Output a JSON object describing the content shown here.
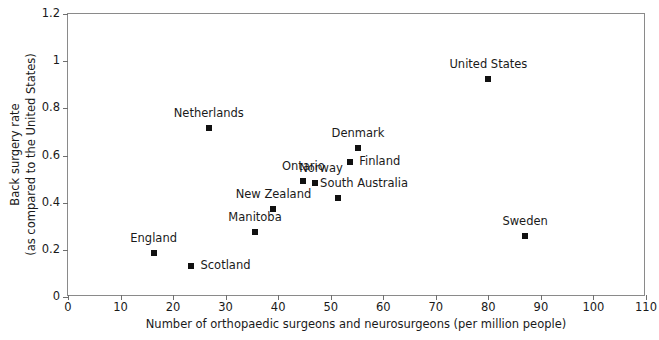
{
  "chart_data": {
    "type": "scatter",
    "title": "",
    "xlabel": "Number of orthopaedic surgeons and neurosurgeons (per million people)",
    "ylabel": "Back surgery rate (as compared to the United States)",
    "ylabel_line1": "Back surgery rate",
    "ylabel_line2": "(as compared to the United States)",
    "xlim": [
      0,
      110
    ],
    "ylim": [
      0,
      1.2
    ],
    "xticks": [
      0,
      10,
      20,
      30,
      40,
      50,
      60,
      70,
      80,
      90,
      100,
      110
    ],
    "xtick_labels": [
      "0",
      "10",
      "20",
      "30",
      "40",
      "50",
      "60",
      "70",
      "80",
      "90",
      "100",
      "110"
    ],
    "yticks": [
      0,
      0.2,
      0.4,
      0.6,
      0.8,
      1,
      1.2
    ],
    "ytick_labels": [
      "0",
      "0.2",
      "0.4",
      "0.6",
      "0.8",
      "1",
      "1.2"
    ],
    "grid": false,
    "legend": "none",
    "marker": "square",
    "marker_color": "#111111",
    "points": [
      {
        "label": "England",
        "x": 16.3,
        "y": 0.185,
        "label_pos": "above",
        "dx": 0,
        "dy": -9
      },
      {
        "label": "Scotland",
        "x": 23.5,
        "y": 0.13,
        "label_pos": "right",
        "dx": 9,
        "dy": 0
      },
      {
        "label": "Netherlands",
        "x": 26.8,
        "y": 0.715,
        "label_pos": "above",
        "dx": 0,
        "dy": -9
      },
      {
        "label": "Manitoba",
        "x": 35.6,
        "y": 0.275,
        "label_pos": "above",
        "dx": 0,
        "dy": -9
      },
      {
        "label": "New Zealand",
        "x": 39.1,
        "y": 0.375,
        "label_pos": "above",
        "dx": 0,
        "dy": -9
      },
      {
        "label": "Ontario",
        "x": 44.8,
        "y": 0.49,
        "label_pos": "above",
        "dx": 0,
        "dy": -9
      },
      {
        "label": "Norway",
        "x": 47.0,
        "y": 0.485,
        "label_pos": "above",
        "dx": 6,
        "dy": -9
      },
      {
        "label": "South Australia",
        "x": 51.4,
        "y": 0.42,
        "label_pos": "above",
        "dx": 26,
        "dy": -9
      },
      {
        "label": "Finland",
        "x": 53.7,
        "y": 0.572,
        "label_pos": "right",
        "dx": 9,
        "dy": 0
      },
      {
        "label": "Denmark",
        "x": 55.2,
        "y": 0.632,
        "label_pos": "above",
        "dx": 0,
        "dy": -9
      },
      {
        "label": "United States",
        "x": 80.0,
        "y": 0.925,
        "label_pos": "above",
        "dx": 0,
        "dy": -9
      },
      {
        "label": "Sweden",
        "x": 87.0,
        "y": 0.26,
        "label_pos": "above",
        "dx": 0,
        "dy": -9
      }
    ]
  }
}
